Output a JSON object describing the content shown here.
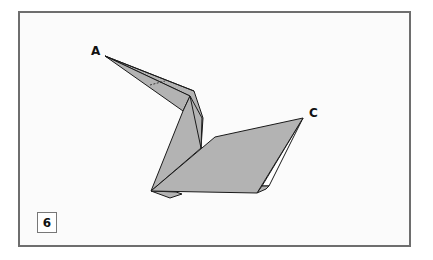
{
  "diagram": {
    "step_number": "6",
    "labels": {
      "point_a": "A",
      "point_c": "C"
    },
    "colors": {
      "frame_border": "#6e6e6e",
      "paper_fill": "#b3b3b3",
      "paper_edge": "#1a1a1a",
      "background": "#fbfbfb",
      "inner_white": "#ffffff"
    }
  }
}
